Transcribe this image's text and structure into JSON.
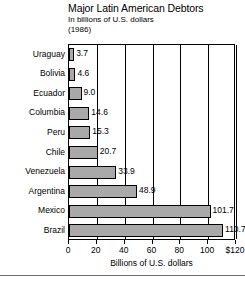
{
  "chart_data": {
    "type": "bar",
    "orientation": "horizontal",
    "title": "Major Latin American Debtors",
    "subtitle": "In billions of U.S. dollars",
    "year": "(1986)",
    "xlabel": "Billions of U.S. dollars",
    "ylabel": "",
    "xlim": [
      0,
      120
    ],
    "grid": true,
    "legend": false,
    "bar_color": "#a9a9a9",
    "bar_border_color": "#000000",
    "categories": [
      "Uraguay",
      "Bolivia",
      "Ecuador",
      "Columbia",
      "Peru",
      "Chile",
      "Venezuela",
      "Argentina",
      "Mexico",
      "Brazil"
    ],
    "values": [
      3.7,
      4.6,
      9.0,
      14.6,
      15.3,
      20.7,
      33.9,
      48.9,
      101.7,
      110.7
    ],
    "value_labels": [
      "3.7",
      "4.6",
      "9.0",
      "14.6",
      "15.3",
      "20.7",
      "33.9",
      "48.9",
      "101.7",
      "110.7"
    ],
    "xticks": [
      0,
      20,
      40,
      60,
      80,
      100,
      120
    ],
    "xtick_labels": [
      "0",
      "20",
      "40",
      "60",
      "80",
      "100",
      "$120"
    ]
  }
}
